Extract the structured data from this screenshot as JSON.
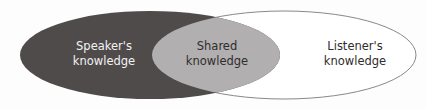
{
  "diagram": {
    "type": "venn",
    "sets": [
      {
        "id": "speaker",
        "label": "Speaker's\nknowledge",
        "fill": "#4f4b4b",
        "text_color": "#f2f2f2"
      },
      {
        "id": "shared",
        "label": "Shared\nknowledge",
        "fill": "#b1afaf",
        "text_color": "#2f2d2d"
      },
      {
        "id": "listener",
        "label": "Listener's\nknowledge",
        "fill": "#ffffff",
        "stroke": "#8a8888",
        "text_color": "#2f2d2d"
      }
    ]
  }
}
